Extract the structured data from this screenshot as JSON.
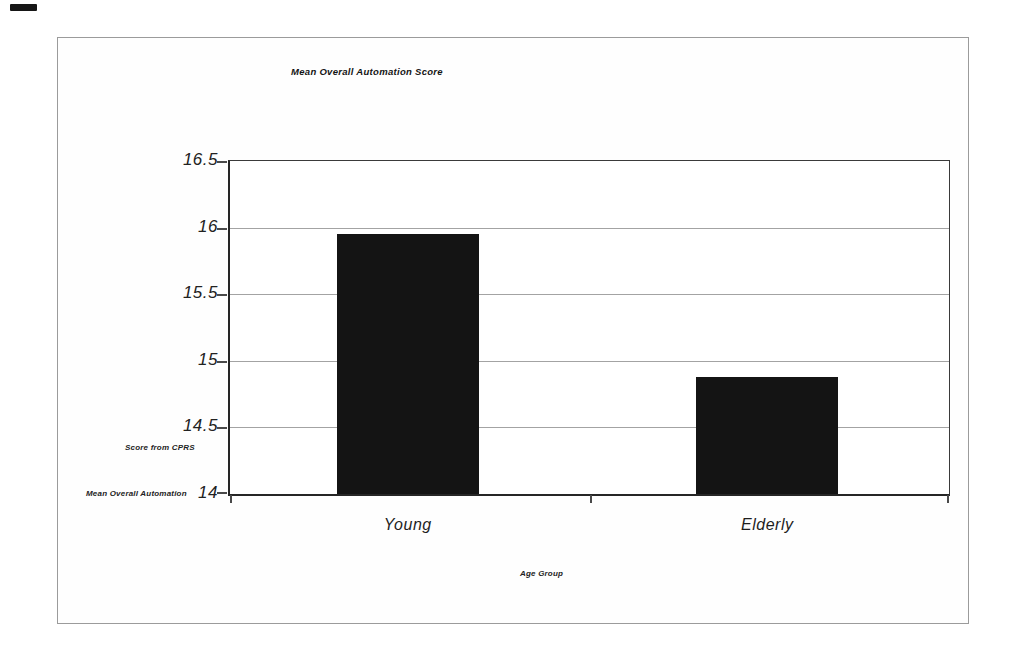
{
  "figure": {
    "title": "Mean Overall Automation Score",
    "y_axis_text_upper": "Score from CPRS",
    "y_axis_text_lower": "Mean Overall Automation",
    "x_axis_title": "Age Group"
  },
  "chart_data": {
    "type": "bar",
    "title": "Mean Overall Automation Score",
    "categories": [
      "Young",
      "Elderly"
    ],
    "values": [
      15.95,
      14.88
    ],
    "xlabel": "Age Group",
    "ylabel": "Mean Overall Automation Score from CPRS",
    "ylim": [
      14,
      16.5
    ],
    "yticks": [
      16.5,
      16,
      15.5,
      15,
      14.5,
      14
    ],
    "ytick_labels": [
      "16.5",
      "16",
      "15.5",
      "15",
      "14.5",
      "14"
    ],
    "bar_color": "#141414",
    "grid": true,
    "legend_position": "none"
  }
}
